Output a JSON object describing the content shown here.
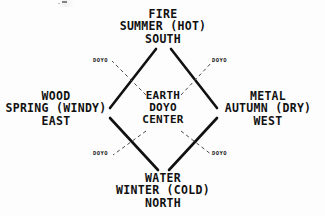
{
  "diagram": {
    "background_color": "#fdfdfd",
    "ink_color": "#111111",
    "nodes": {
      "fire": {
        "element": "FIRE",
        "season": "SUMMER (HOT)",
        "direction": "SOUTH",
        "position": "top"
      },
      "wood": {
        "element": "WOOD",
        "season": "SPRING (WINDY)",
        "direction": "EAST",
        "position": "left"
      },
      "metal": {
        "element": "METAL",
        "season": "AUTUMN (DRY)",
        "direction": "WEST",
        "position": "right"
      },
      "water": {
        "element": "WATER",
        "season": "WINTER (COLD)",
        "direction": "NORTH",
        "position": "bottom"
      },
      "earth": {
        "element": "EARTH",
        "season": "DOYO",
        "direction": "CENTER",
        "position": "center"
      }
    },
    "doyo_markers": {
      "northwest": "DOYO",
      "northeast": "DOYO",
      "southwest": "DOYO",
      "southeast": "DOYO"
    }
  }
}
